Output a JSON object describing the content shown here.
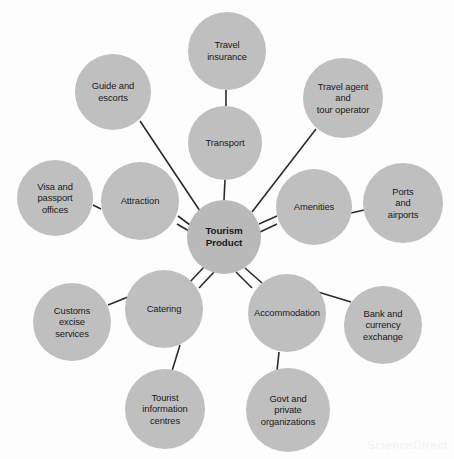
{
  "diagram": {
    "title": "Tourism Product",
    "type": "hub-and-spoke",
    "colors": {
      "node_fill": "#bfbfbf",
      "hub_fill": "#b9b9b9",
      "edge": "#2b2b2b",
      "background": "#fdfdfd",
      "text": "#1a1a1a"
    },
    "hub": {
      "label": "Tourism\nProduct",
      "cx": 224,
      "cy": 237,
      "r": 37
    },
    "nodes": [
      {
        "id": "travel-insurance",
        "label": "Travel\ninsurance",
        "cx": 227,
        "cy": 51,
        "r": 39
      },
      {
        "id": "transport",
        "label": "Transport",
        "cx": 225,
        "cy": 143,
        "r": 37
      },
      {
        "id": "guide-escorts",
        "label": "Guide and\nescorts",
        "cx": 113,
        "cy": 92,
        "r": 38
      },
      {
        "id": "travel-agent",
        "label": "Travel agent\nand\ntour operator",
        "cx": 343,
        "cy": 98,
        "r": 40
      },
      {
        "id": "visa-passport",
        "label": "Visa and\npassport\noffices",
        "cx": 55,
        "cy": 198,
        "r": 38
      },
      {
        "id": "attraction",
        "label": "Attraction",
        "cx": 140,
        "cy": 201,
        "r": 39
      },
      {
        "id": "amenities",
        "label": "Amenities",
        "cx": 314,
        "cy": 207,
        "r": 38
      },
      {
        "id": "ports-airports",
        "label": "Ports\nand\nairports",
        "cx": 403,
        "cy": 203,
        "r": 40
      },
      {
        "id": "customs-excise",
        "label": "Customs\nexcise\nservices",
        "cx": 72,
        "cy": 322,
        "r": 39
      },
      {
        "id": "catering",
        "label": "Catering",
        "cx": 164,
        "cy": 309,
        "r": 39
      },
      {
        "id": "accommodation",
        "label": "Accommodation",
        "cx": 287,
        "cy": 313,
        "r": 39
      },
      {
        "id": "bank-currency",
        "label": "Bank and\ncurrency\nexchange",
        "cx": 383,
        "cy": 325,
        "r": 39
      },
      {
        "id": "tourist-info",
        "label": "Tourist\ninformation\ncentres",
        "cx": 165,
        "cy": 409,
        "r": 40
      },
      {
        "id": "govt-private",
        "label": "Govt and\nprivate\norganizations",
        "cx": 288,
        "cy": 410,
        "r": 42
      }
    ],
    "edges": [
      {
        "from": "travel-insurance",
        "to": "transport",
        "x1": 226,
        "y1": 90,
        "x2": 226,
        "y2": 106
      },
      {
        "from": "transport",
        "to": "hub",
        "x1": 225,
        "y1": 180,
        "x2": 224,
        "y2": 200
      },
      {
        "from": "guide-escorts",
        "to": "hub",
        "x1": 140,
        "y1": 121,
        "x2": 200,
        "y2": 211
      },
      {
        "from": "travel-agent",
        "to": "hub",
        "x1": 316,
        "y1": 129,
        "x2": 252,
        "y2": 212
      },
      {
        "from": "visa-passport",
        "to": "attraction",
        "x1": 93,
        "y1": 205,
        "x2": 101,
        "y2": 209
      },
      {
        "from": "attraction",
        "to": "hub",
        "x1": 178,
        "y1": 216,
        "x2": 190,
        "y2": 225
      },
      {
        "from": "attraction",
        "to": "hub",
        "x1": 177,
        "y1": 224,
        "x2": 189,
        "y2": 231
      },
      {
        "from": "hub",
        "to": "amenities",
        "x1": 259,
        "y1": 224,
        "x2": 277,
        "y2": 216
      },
      {
        "from": "hub",
        "to": "amenities",
        "x1": 260,
        "y1": 232,
        "x2": 277,
        "y2": 224
      },
      {
        "from": "amenities",
        "to": "ports-airports",
        "x1": 351,
        "y1": 213,
        "x2": 364,
        "y2": 210
      },
      {
        "from": "hub",
        "to": "catering",
        "x1": 205,
        "y1": 266,
        "x2": 189,
        "y2": 283
      },
      {
        "from": "hub",
        "to": "catering",
        "x1": 214,
        "y1": 272,
        "x2": 199,
        "y2": 288
      },
      {
        "from": "customs-excise",
        "to": "catering",
        "x1": 108,
        "y1": 305,
        "x2": 128,
        "y2": 297
      },
      {
        "from": "catering",
        "to": "tourist-info",
        "x1": 180,
        "y1": 345,
        "x2": 172,
        "y2": 371
      },
      {
        "from": "hub",
        "to": "accommodation",
        "x1": 236,
        "y1": 272,
        "x2": 252,
        "y2": 288
      },
      {
        "from": "hub",
        "to": "accommodation",
        "x1": 245,
        "y1": 268,
        "x2": 262,
        "y2": 283
      },
      {
        "from": "accommodation",
        "to": "bank-currency",
        "x1": 318,
        "y1": 292,
        "x2": 351,
        "y2": 302
      },
      {
        "from": "accommodation",
        "to": "govt-private",
        "x1": 279,
        "y1": 352,
        "x2": 277,
        "y2": 371
      }
    ],
    "watermark": "ScienceDirect"
  }
}
